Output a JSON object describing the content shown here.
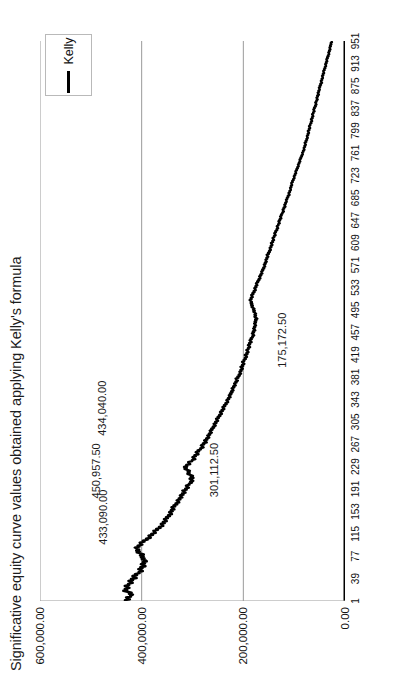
{
  "chart_data": {
    "type": "line",
    "title": "Significative equity curve values obtained applying Kelly's formula",
    "xlabel": "",
    "ylabel": "",
    "orientation": "rotated-90-ccw",
    "grid": true,
    "legend": {
      "position": "top-right",
      "entries": [
        {
          "name": "Kelly",
          "color": "#000000",
          "marker": "line"
        }
      ]
    },
    "xlim": [
      1,
      951
    ],
    "ylim": [
      0,
      600000
    ],
    "xticks": [
      1,
      39,
      77,
      115,
      153,
      191,
      229,
      267,
      305,
      343,
      381,
      419,
      457,
      495,
      533,
      571,
      609,
      647,
      685,
      723,
      761,
      799,
      837,
      875,
      913,
      951
    ],
    "xticklabels": [
      "1",
      "39",
      "77",
      "115",
      "153",
      "191",
      "229",
      "267",
      "305",
      "343",
      "381",
      "419",
      "457",
      "495",
      "533",
      "571",
      "609",
      "647",
      "685",
      "723",
      "761",
      "799",
      "837",
      "875",
      "913",
      "951"
    ],
    "yticks": [
      0,
      200000,
      400000,
      600000
    ],
    "yticklabels": [
      "0.00",
      "200,000.00",
      "400,000.00",
      "600,000.00"
    ],
    "annotations": [
      {
        "label": "433,090.00",
        "x": 150,
        "y": 433090
      },
      {
        "label": "450,957.50",
        "x": 232,
        "y": 450957.5
      },
      {
        "label": "301,112.50",
        "x": 196,
        "y": 301112.5
      },
      {
        "label": "434,040.00",
        "x": 345,
        "y": 434040
      },
      {
        "label": "175,172.50",
        "x": 423,
        "y": 175172.5
      }
    ],
    "series": [
      {
        "name": "Kelly",
        "color": "#000000",
        "x": [
          1,
          10,
          20,
          30,
          40,
          50,
          60,
          70,
          80,
          90,
          100,
          110,
          120,
          130,
          140,
          150,
          160,
          170,
          180,
          190,
          200,
          210,
          220,
          230,
          240,
          250,
          260,
          270,
          280,
          290,
          300,
          310,
          320,
          330,
          340,
          350,
          360,
          370,
          380,
          390,
          400,
          410,
          420,
          430,
          440,
          450,
          460,
          470,
          480,
          490,
          500,
          510,
          520,
          530,
          540,
          550,
          560,
          570,
          580,
          590,
          600,
          610,
          620,
          630,
          640,
          650,
          660,
          670,
          680,
          690,
          700,
          710,
          720,
          730,
          740,
          750,
          760,
          770,
          780,
          790,
          800,
          810,
          820,
          830,
          840,
          850,
          860,
          870,
          880,
          890,
          900,
          910,
          920,
          930,
          940,
          951
        ],
        "y": [
          433090,
          420000,
          433090,
          425000,
          415000,
          405000,
          398000,
          392000,
          402000,
          410000,
          398000,
          384000,
          372000,
          360000,
          352000,
          344000,
          338000,
          330000,
          322000,
          314000,
          305000,
          301112,
          308000,
          314000,
          300000,
          292000,
          284000,
          276000,
          268000,
          262000,
          256000,
          250000,
          244000,
          238000,
          232000,
          226000,
          222000,
          216000,
          211000,
          206000,
          202000,
          198000,
          194000,
          190000,
          186000,
          182000,
          179000,
          176000,
          175172,
          177000,
          181000,
          186000,
          182000,
          177000,
          173000,
          168000,
          163000,
          159000,
          155000,
          151000,
          147000,
          143000,
          139000,
          135000,
          131000,
          127000,
          123000,
          119000,
          115000,
          111000,
          107000,
          104000,
          100000,
          96000,
          92000,
          88000,
          84000,
          80000,
          77000,
          74000,
          71000,
          68000,
          65000,
          62000,
          59000,
          56000,
          53000,
          50000,
          47000,
          44000,
          41000,
          38000,
          35000,
          32000,
          29000,
          27000
        ]
      }
    ]
  },
  "figure": {
    "title": "Significative equity curve values obtained applying Kelly's formula"
  }
}
